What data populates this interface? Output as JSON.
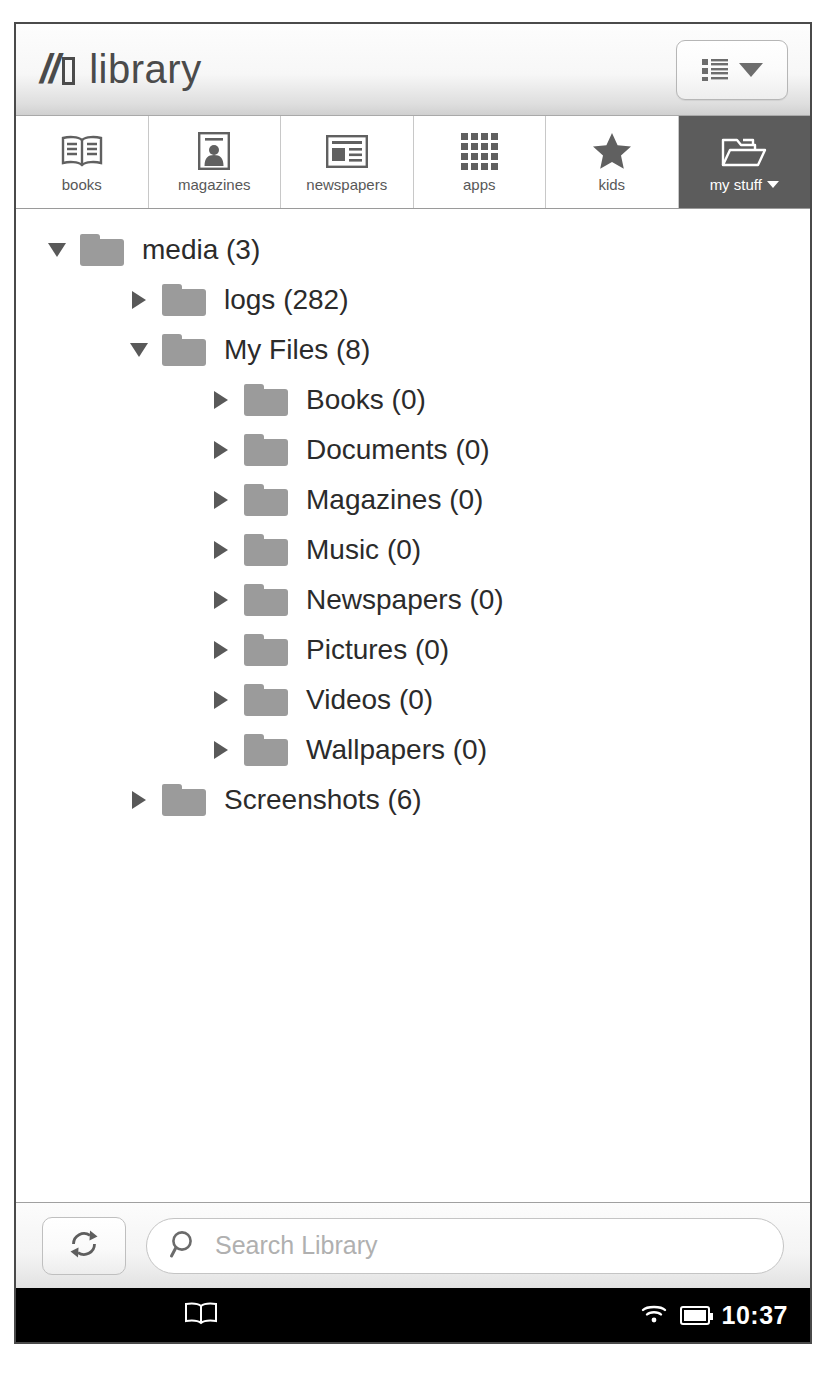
{
  "titlebar": {
    "brand_mark": "//",
    "brand_word": "library",
    "view_toggle": {
      "icon": "list-view-icon",
      "caret": "chevron-down-icon"
    }
  },
  "tabs": [
    {
      "label": "books",
      "icon": "open-book-icon",
      "active": false,
      "caret": false
    },
    {
      "label": "magazines",
      "icon": "magazine-icon",
      "active": false,
      "caret": false
    },
    {
      "label": "newspapers",
      "icon": "newspaper-icon",
      "active": false,
      "caret": false
    },
    {
      "label": "apps",
      "icon": "grid-apps-icon",
      "active": false,
      "caret": false
    },
    {
      "label": "kids",
      "icon": "star-icon",
      "active": false,
      "caret": false
    },
    {
      "label": "my stuff",
      "icon": "open-folder-icon",
      "active": true,
      "caret": true
    }
  ],
  "tree": [
    {
      "label": "media (3)",
      "name": "media",
      "count": 3,
      "depth": 0,
      "expanded": true,
      "selected": false
    },
    {
      "label": "logs (282)",
      "name": "logs",
      "count": 282,
      "depth": 1,
      "expanded": false,
      "selected": false
    },
    {
      "label": "My Files (8)",
      "name": "My Files",
      "count": 8,
      "depth": 1,
      "expanded": true,
      "selected": true
    },
    {
      "label": "Books (0)",
      "name": "Books",
      "count": 0,
      "depth": 2,
      "expanded": false,
      "selected": false
    },
    {
      "label": "Documents (0)",
      "name": "Documents",
      "count": 0,
      "depth": 2,
      "expanded": false,
      "selected": false
    },
    {
      "label": "Magazines (0)",
      "name": "Magazines",
      "count": 0,
      "depth": 2,
      "expanded": false,
      "selected": false
    },
    {
      "label": "Music (0)",
      "name": "Music",
      "count": 0,
      "depth": 2,
      "expanded": false,
      "selected": false
    },
    {
      "label": "Newspapers (0)",
      "name": "Newspapers",
      "count": 0,
      "depth": 2,
      "expanded": false,
      "selected": false
    },
    {
      "label": "Pictures (0)",
      "name": "Pictures",
      "count": 0,
      "depth": 2,
      "expanded": false,
      "selected": false
    },
    {
      "label": "Videos (0)",
      "name": "Videos",
      "count": 0,
      "depth": 2,
      "expanded": false,
      "selected": false
    },
    {
      "label": "Wallpapers (0)",
      "name": "Wallpapers",
      "count": 0,
      "depth": 2,
      "expanded": false,
      "selected": false
    },
    {
      "label": "Screenshots (6)",
      "name": "Screenshots",
      "count": 6,
      "depth": 1,
      "expanded": false,
      "selected": false
    }
  ],
  "searchbar": {
    "refresh_icon": "refresh-icon",
    "search_icon": "magnifier-icon",
    "placeholder": "Search Library",
    "value": ""
  },
  "statusbar": {
    "notification_icon": "book-icon",
    "wifi_icon": "wifi-icon",
    "battery_icon": "battery-full-icon",
    "clock": "10:37"
  },
  "colors": {
    "active_tab_bg": "#5c5c5c",
    "selected_row_bg": "#dcdcdc",
    "folder": "#9b9b9b",
    "text": "#2b2b2b",
    "statusbar_bg": "#000000"
  }
}
